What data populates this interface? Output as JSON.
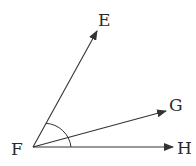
{
  "diagram": {
    "type": "geometry-angle-rays",
    "vertex": {
      "label": "F",
      "x": 33,
      "y": 147
    },
    "rays": [
      {
        "label": "E",
        "tip_x": 97,
        "tip_y": 31
      },
      {
        "label": "G",
        "tip_x": 166,
        "tip_y": 111
      },
      {
        "label": "H",
        "tip_x": 173,
        "tip_y": 147
      }
    ],
    "arc": {
      "from": "E",
      "to": "H",
      "radius": 38
    },
    "stroke_color": "#333333"
  },
  "labels": {
    "E": "E",
    "F": "F",
    "G": "G",
    "H": "H"
  }
}
